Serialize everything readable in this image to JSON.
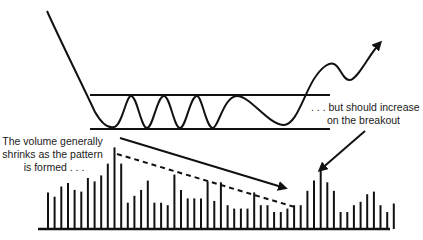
{
  "diagram": {
    "colors": {
      "ink": "#111111",
      "background": "#ffffff"
    },
    "annotations": {
      "volume_shrinks": [
        "The volume generally",
        "shrinks as the pattern",
        "is formed . . ."
      ],
      "volume_increase": [
        ". . . but should increase",
        "on the breakout"
      ]
    },
    "price_pattern": {
      "type": "rectangle",
      "resistance_label": "upper boundary",
      "support_label": "lower boundary",
      "breakout_direction": "up"
    },
    "volume": {
      "description": "relative volume bar heights (0-1 scale, tallest = 1)",
      "bars": [
        0.43,
        0.38,
        0.5,
        0.54,
        0.46,
        0.44,
        0.6,
        0.56,
        0.63,
        0.77,
        0.96,
        0.77,
        0.31,
        0.39,
        0.46,
        0.57,
        0.31,
        0.31,
        0.28,
        0.64,
        0.46,
        0.36,
        0.36,
        0.36,
        0.56,
        0.33,
        0.55,
        0.28,
        0.24,
        0.24,
        0.24,
        0.43,
        0.28,
        0.28,
        0.2,
        0.2,
        0.24,
        0.28,
        0.28,
        0.45,
        0.57,
        0.7,
        0.55,
        0.45,
        0.2,
        0.2,
        0.28,
        0.32,
        0.41,
        0.44,
        0.28,
        0.2,
        0.3
      ]
    }
  }
}
